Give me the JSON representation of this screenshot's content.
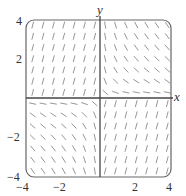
{
  "figure": {
    "type": "slope-field",
    "frame": {
      "left": 26,
      "top": 20,
      "right": 171,
      "bottom": 177,
      "corner_radius": 8,
      "stroke": "#666666"
    },
    "origin_px": {
      "x": 100,
      "y": 98
    },
    "xlim": [
      -4,
      4
    ],
    "ylim": [
      -4,
      4
    ],
    "axis_color": "#444444",
    "segment_color": "#8a8a8a",
    "grid_count": 14,
    "segment_length": 7
  },
  "axes": {
    "x_label": "x",
    "y_label": "y"
  },
  "ticks": {
    "x": [
      {
        "value": -4,
        "label": "−4"
      },
      {
        "value": -2,
        "label": "−2"
      },
      {
        "value": 2,
        "label": "2"
      },
      {
        "value": 4,
        "label": "4"
      }
    ],
    "y": [
      {
        "value": 4,
        "label": "4"
      },
      {
        "value": 2,
        "label": "2"
      },
      {
        "value": -2,
        "label": "−2"
      },
      {
        "value": -4,
        "label": "−4"
      }
    ]
  },
  "chart_data": {
    "type": "slope-field",
    "title": "",
    "xlabel": "x",
    "ylabel": "y",
    "xlim": [
      -4,
      4
    ],
    "ylim": [
      -4,
      4
    ],
    "grid": false,
    "x_ticks": [
      -4,
      -2,
      2,
      4
    ],
    "y_ticks": [
      -4,
      -2,
      2,
      4
    ]
  }
}
